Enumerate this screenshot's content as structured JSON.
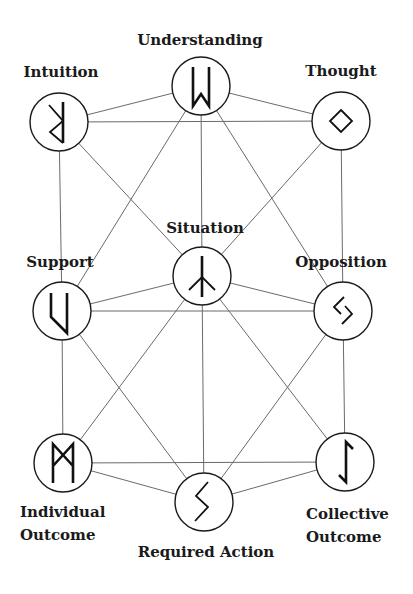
{
  "diagram": {
    "title": "",
    "nodes": [
      {
        "id": "understanding",
        "label": "Understanding",
        "rune": "wunjo-reversed",
        "cx": 201,
        "cy": 86
      },
      {
        "id": "intuition",
        "label": "Intuition",
        "rune": "perthro-like",
        "cx": 59,
        "cy": 122
      },
      {
        "id": "thought",
        "label": "Thought",
        "rune": "ingwaz-diamond",
        "cx": 341,
        "cy": 121
      },
      {
        "id": "situation",
        "label": "Situation",
        "rune": "algiz-inverted",
        "cx": 202,
        "cy": 276
      },
      {
        "id": "support",
        "label": "Support",
        "rune": "uruz-like",
        "cx": 62,
        "cy": 311
      },
      {
        "id": "opposition",
        "label": "Opposition",
        "rune": "jera",
        "cx": 343,
        "cy": 311
      },
      {
        "id": "individual_outcome",
        "label_lines": [
          "Individual",
          "Outcome"
        ],
        "rune": "mannaz",
        "cx": 63,
        "cy": 463
      },
      {
        "id": "required_action",
        "label": "Required Action",
        "rune": "sowilo",
        "cx": 204,
        "cy": 502
      },
      {
        "id": "collective_outcome",
        "label_lines": [
          "Collective",
          "Outcome"
        ],
        "rune": "eihwaz",
        "cx": 345,
        "cy": 462
      }
    ],
    "edges": [
      [
        "intuition",
        "understanding"
      ],
      [
        "intuition",
        "thought"
      ],
      [
        "understanding",
        "thought"
      ],
      [
        "intuition",
        "support"
      ],
      [
        "thought",
        "opposition"
      ],
      [
        "intuition",
        "situation"
      ],
      [
        "thought",
        "situation"
      ],
      [
        "understanding",
        "support"
      ],
      [
        "understanding",
        "opposition"
      ],
      [
        "understanding",
        "situation"
      ],
      [
        "support",
        "opposition"
      ],
      [
        "support",
        "situation"
      ],
      [
        "opposition",
        "situation"
      ],
      [
        "support",
        "individual_outcome"
      ],
      [
        "opposition",
        "collective_outcome"
      ],
      [
        "support",
        "required_action"
      ],
      [
        "opposition",
        "required_action"
      ],
      [
        "situation",
        "individual_outcome"
      ],
      [
        "situation",
        "collective_outcome"
      ],
      [
        "situation",
        "required_action"
      ],
      [
        "individual_outcome",
        "collective_outcome"
      ],
      [
        "individual_outcome",
        "required_action"
      ],
      [
        "collective_outcome",
        "required_action"
      ]
    ],
    "labels": {
      "understanding": "Understanding",
      "intuition": "Intuition",
      "thought": "Thought",
      "situation": "Situation",
      "support": "Support",
      "opposition": "Opposition",
      "individual_line1": "Individual",
      "individual_line2": "Outcome",
      "required_action": "Required Action",
      "collective_line1": "Collective",
      "collective_line2": "Outcome"
    },
    "colors": {
      "background": "#ffffff",
      "edge": "#6a6a6a",
      "stroke": "#1a1a1a"
    }
  }
}
